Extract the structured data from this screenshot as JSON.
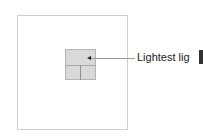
{
  "diagram": {
    "outer_box": {
      "label": ""
    },
    "inner_box": {
      "fill": "#d9d9d9",
      "regions": [
        "top",
        "bottom-left",
        "bottom-right"
      ]
    },
    "callout": {
      "label": "Lightest lig",
      "target_region": "top"
    }
  }
}
